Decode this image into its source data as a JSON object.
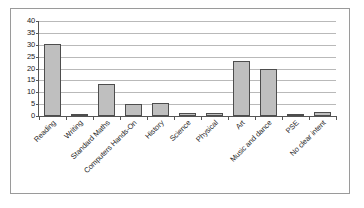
{
  "chart_data": {
    "type": "bar",
    "title": "",
    "subtitle": "",
    "xlabel": "",
    "ylabel": "",
    "ylim": [
      0,
      40
    ],
    "yticks": [
      0,
      5,
      10,
      15,
      20,
      25,
      30,
      35,
      40
    ],
    "ytick_labels": [
      "0",
      "5",
      "10",
      "15",
      "20",
      "25",
      "30",
      "35",
      "40"
    ],
    "grid": true,
    "legend": false,
    "legend_position": "none",
    "orientation": "vertical",
    "bar_fill_color": "#BFBFBF",
    "bar_edge_color": "#4D4D4D",
    "gridline_color": "#B9B9B9",
    "axis_color": "#555555",
    "frame_color": "#9A9A9A",
    "background_color": "#FFFFFF",
    "xtick_label_rotation": -45,
    "categories": [
      "Reading",
      "Writing",
      "Standard Maths",
      "Computers Hands-On",
      "History",
      "Science",
      "Physical",
      "Art",
      "Music and dance",
      "PSE",
      "No clear intent"
    ],
    "values": [
      30.5,
      0.3,
      13.6,
      5.2,
      5.3,
      1.3,
      1.3,
      23.0,
      19.8,
      0.7,
      1.8
    ],
    "series": [
      {
        "name": "Series 1",
        "values": [
          30.5,
          0.3,
          13.6,
          5.2,
          5.3,
          1.3,
          1.3,
          23.0,
          19.8,
          0.7,
          1.8
        ]
      }
    ]
  }
}
